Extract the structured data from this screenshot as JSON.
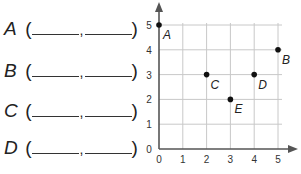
{
  "worksheet": {
    "rows": [
      {
        "label": "A",
        "open": "(",
        "comma": ",",
        "close": ")"
      },
      {
        "label": "B",
        "open": "(",
        "comma": ",",
        "close": ")"
      },
      {
        "label": "C",
        "open": "(",
        "comma": ",",
        "close": ")"
      },
      {
        "label": "D",
        "open": "(",
        "comma": ",",
        "close": ")"
      }
    ]
  },
  "chart_data": {
    "type": "scatter",
    "title": "",
    "xlabel": "",
    "ylabel": "",
    "xlim": [
      0,
      5
    ],
    "ylim": [
      0,
      5
    ],
    "grid": true,
    "x_ticks": [
      "0",
      "1",
      "2",
      "3",
      "4",
      "5"
    ],
    "y_ticks": [
      "0",
      "1",
      "2",
      "3",
      "4",
      "5"
    ],
    "points": [
      {
        "label": "A",
        "x": 0,
        "y": 5
      },
      {
        "label": "B",
        "x": 5,
        "y": 4
      },
      {
        "label": "C",
        "x": 2,
        "y": 3
      },
      {
        "label": "D",
        "x": 4,
        "y": 3
      },
      {
        "label": "E",
        "x": 3,
        "y": 2
      }
    ],
    "legend": "none"
  }
}
